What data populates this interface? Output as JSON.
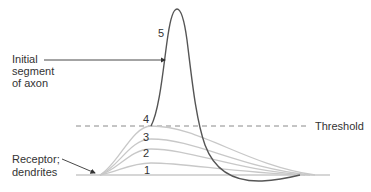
{
  "diagram": {
    "labels": {
      "initial_segment_line1": "Initial",
      "initial_segment_line2": "segment",
      "initial_segment_line3": "of axon",
      "receptor_line1": "Receptor;",
      "receptor_line2": "dendrites",
      "threshold": "Threshold"
    },
    "curve_numbers": [
      "1",
      "2",
      "3",
      "4",
      "5"
    ],
    "colors": {
      "action_potential": "#555555",
      "graded_potentials": "#c8c8c8",
      "threshold_line": "#888888",
      "baseline": "#c8c8c8",
      "arrows": "#333333",
      "text": "#333333"
    }
  }
}
